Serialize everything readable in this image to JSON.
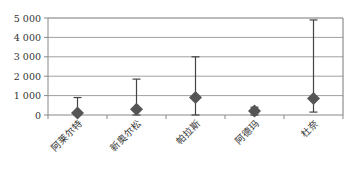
{
  "chart_data": {
    "type": "scatter",
    "title": "",
    "xlabel": "",
    "ylabel": "",
    "categories": [
      "阿莱尔特",
      "新奥尔松",
      "帕拉斯",
      "阿德玛",
      "杜奈"
    ],
    "series": [
      {
        "name": "",
        "marker": "diamond",
        "values": [
          100,
          300,
          900,
          200,
          850
        ],
        "error_low": [
          0,
          0,
          0,
          0,
          150
        ],
        "error_high": [
          900,
          1850,
          3000,
          400,
          4900
        ]
      }
    ],
    "ylim": [
      0,
      5000
    ],
    "yticks": [
      0,
      1000,
      2000,
      3000,
      4000,
      5000
    ],
    "ytick_labels": [
      "0",
      "1 000",
      "2 000",
      "3 000",
      "4 000",
      "5 000"
    ],
    "grid": true,
    "legend": "none",
    "colors": {
      "marker": "#555555",
      "grid": "#a0a0a0",
      "axis": "#888888",
      "error_bar": "#444444"
    }
  }
}
